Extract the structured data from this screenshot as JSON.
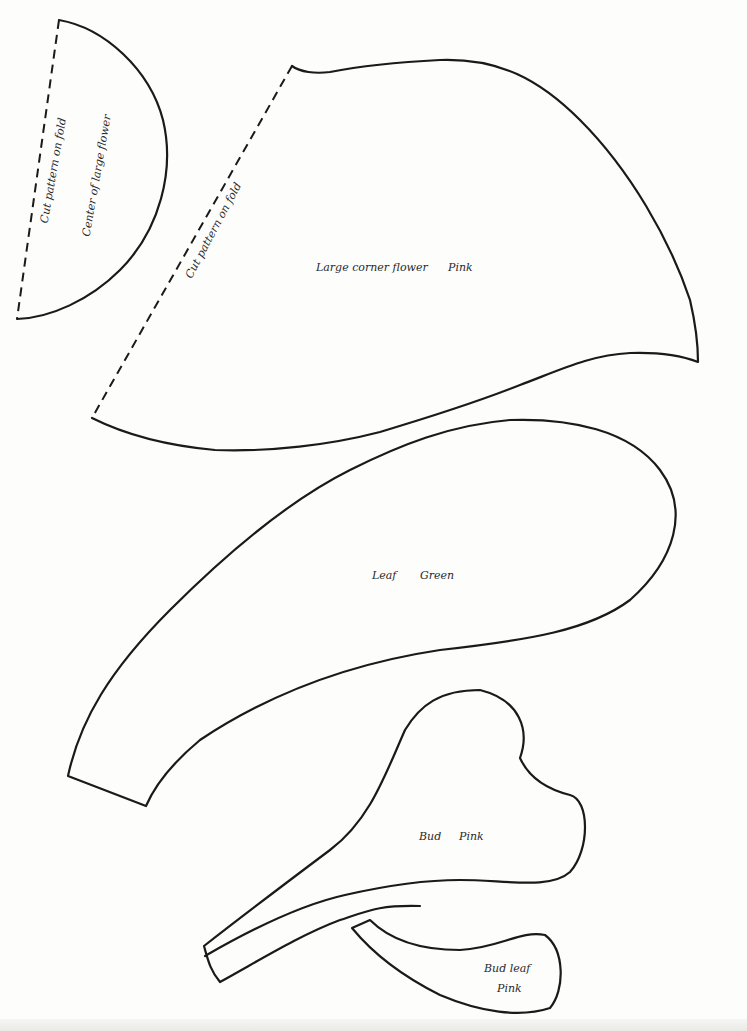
{
  "page": {
    "type": "sewing pattern sheet",
    "background": "#fdfdfc",
    "line_color": "#1a1a1a"
  },
  "pieces": [
    {
      "id": "center-of-large-flower",
      "labels": [
        "Cut pattern on fold",
        "Center of large flower"
      ],
      "fold_label": "Cut pattern on fold",
      "name_label": "Center of large flower"
    },
    {
      "id": "large-corner-flower",
      "fold_label": "Cut pattern on fold",
      "name_label": "Large corner flower",
      "color_label": "Pink"
    },
    {
      "id": "leaf",
      "name_label": "Leaf",
      "color_label": "Green"
    },
    {
      "id": "bud",
      "name_label": "Bud",
      "color_label": "Pink"
    },
    {
      "id": "bud-leaf",
      "name_label": "Bud leaf",
      "color_label": "Pink"
    }
  ]
}
